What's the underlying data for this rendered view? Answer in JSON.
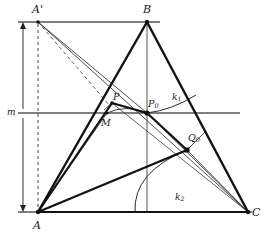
{
  "figure": {
    "type": "geometry-construction",
    "width": 271,
    "height": 236,
    "background": "#ffffff",
    "stroke_color": "#1a1a1a",
    "thin_stroke_color": "#3a3a3a",
    "rule_color": "#555555"
  },
  "labels": {
    "A": "A",
    "A_prime": "A'",
    "B": "B",
    "C": "C",
    "P": "P",
    "M": "M",
    "P0_main": "P",
    "P0_sub": "0",
    "Q0_main": "Q",
    "Q0_sub": "0",
    "k1_main": "k",
    "k1_sub": "1",
    "k2_main": "k",
    "k2_sub": "2",
    "m": "m"
  },
  "points": {
    "A": {
      "x": 38,
      "y": 212,
      "label": "A",
      "marker": "vertex"
    },
    "A_prime": {
      "x": 38,
      "y": 22,
      "label": "A'",
      "marker": "vertex"
    },
    "B": {
      "x": 147,
      "y": 22,
      "label": "B",
      "marker": "vertex"
    },
    "C": {
      "x": 248,
      "y": 212,
      "label": "C",
      "marker": "vertex"
    },
    "P": {
      "x": 112,
      "y": 103,
      "label": "P",
      "marker": "dot"
    },
    "M": {
      "x": 107,
      "y": 113,
      "label": "M",
      "marker": "dot"
    },
    "P0": {
      "x": 147,
      "y": 113,
      "label": "P0",
      "marker": "dot"
    },
    "Q0": {
      "x": 187,
      "y": 150,
      "label": "Q0",
      "marker": "square"
    }
  },
  "lines": {
    "triangle_AB": {
      "from": "A",
      "to": "B",
      "weight": "bold"
    },
    "triangle_BC": {
      "from": "B",
      "to": "C",
      "weight": "bold"
    },
    "triangle_AC": {
      "from": "A",
      "to": "C",
      "weight": "bold"
    },
    "altitude_B": {
      "from": "B",
      "to": "baseline",
      "weight": "thin"
    },
    "top_rule": {
      "y": 22,
      "from_x": 18,
      "to_x": 160,
      "weight": "rule"
    },
    "mid_rule": {
      "y": 113,
      "from_x": 18,
      "to_x": 240,
      "weight": "rule",
      "label": "m"
    },
    "base_rule": {
      "y": 212,
      "from_x": 18,
      "to_x": 252,
      "weight": "rule"
    },
    "A_prime_to_C": {
      "from": "A_prime",
      "to": "C",
      "weight": "thin",
      "style": "solid"
    },
    "A_prime_to_P0": {
      "from": "A_prime",
      "to": "P0",
      "weight": "thin",
      "style": "solid"
    },
    "A_prime_dashed_to_P": {
      "from": "A_prime",
      "to": "P",
      "weight": "thin",
      "style": "dashed"
    },
    "A_prime_vertical": {
      "from": "A_prime",
      "to": "A",
      "weight": "thin",
      "style": "dashed"
    },
    "A_to_P_bold": {
      "from": "A",
      "to": "P",
      "weight": "bold"
    },
    "P_to_P0_bold": {
      "from": "P",
      "to": "P0",
      "weight": "bold"
    },
    "A_to_M": {
      "from": "A",
      "to": "M",
      "weight": "thin"
    },
    "A_to_Q0_bold": {
      "from": "A",
      "to": "Q0",
      "weight": "bold"
    },
    "P0_to_Q0_bold": {
      "from": "P0",
      "to": "Q0",
      "weight": "bold"
    },
    "Q0_to_C": {
      "from": "Q0",
      "to": "C",
      "weight": "thin"
    },
    "A_to_C_thin": {
      "from": "A",
      "to": "C",
      "weight": "thin"
    },
    "P0_to_C": {
      "from": "P0",
      "to": "C",
      "weight": "thin"
    },
    "P_to_C": {
      "from": "P",
      "to": "C",
      "weight": "thin"
    }
  },
  "arcs": {
    "k1": {
      "center": "P0",
      "label": "k1",
      "description": "arc through P0 curving right toward side BC"
    },
    "k2": {
      "center": "C",
      "label": "k2",
      "description": "arc from baseline up through Q0"
    }
  },
  "dimension": {
    "label": "m",
    "from_y": 22,
    "to_y": 212,
    "x": 23,
    "tick_y": 113,
    "description": "double-headed vertical dimension arrow spanning the figure height, split at the midline"
  }
}
